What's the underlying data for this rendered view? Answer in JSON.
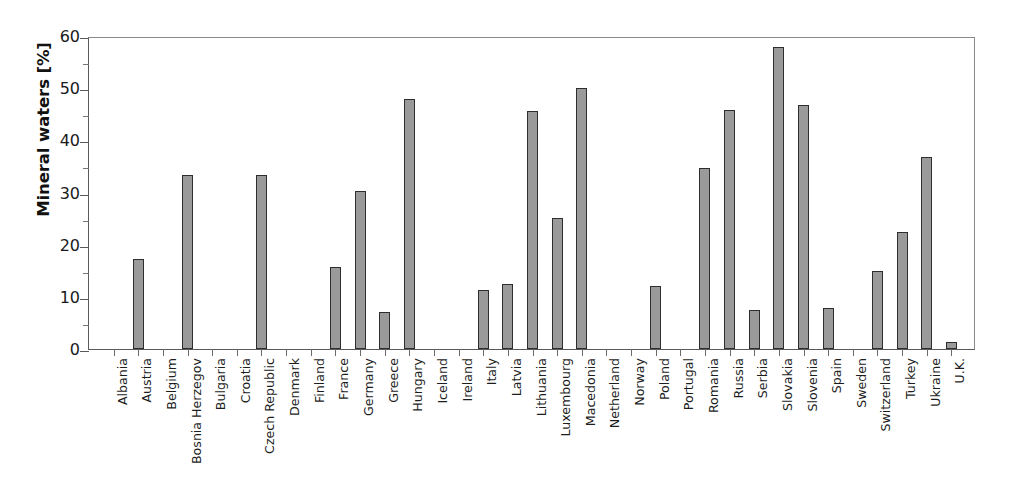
{
  "chart_data": {
    "type": "bar",
    "title": "",
    "xlabel": "",
    "ylabel": "Mineral waters [%]",
    "ylim": [
      0,
      60
    ],
    "ytick_values": [
      0,
      10,
      20,
      30,
      40,
      50,
      60
    ],
    "ytick_labels": [
      "0",
      "10",
      "20",
      "30",
      "40",
      "50",
      "60"
    ],
    "yminor_values": [
      5,
      15,
      25,
      35,
      45,
      55
    ],
    "grid": false,
    "legend": "none",
    "bar_fill_color": "#9a9a9a",
    "bar_edge_color": "#2e2e2e",
    "axis_color": "#5a5a5a",
    "categories": [
      "Albania",
      "Austria",
      "Belgium",
      "Bosnia Herzegov",
      "Bulgaria",
      "Croatia",
      "Czech Republic",
      "Denmark",
      "Finland",
      "France",
      "Germany",
      "Greece",
      "Hungary",
      "Iceland",
      "Ireland",
      "Italy",
      "Latvia",
      "Lithuania",
      "Luxembourg",
      "Macedonia",
      "Netherland",
      "Norway",
      "Poland",
      "Portugal",
      "Romania",
      "Russia",
      "Serbia",
      "Slovakia",
      "Slovenia",
      "Spain",
      "Sweden",
      "Switzerland",
      "Turkey",
      "Ukraine",
      "U.K."
    ],
    "values": [
      0,
      17.3,
      0,
      33.4,
      0,
      0,
      33.4,
      0,
      0,
      15.7,
      30.3,
      7.1,
      47.9,
      0,
      0,
      11.4,
      12.4,
      45.6,
      25.1,
      50.1,
      0,
      0,
      12.0,
      0,
      34.7,
      45.9,
      7.5,
      57.9,
      46.7,
      7.8,
      0,
      14.9,
      22.5,
      36.9,
      1.3
    ]
  }
}
